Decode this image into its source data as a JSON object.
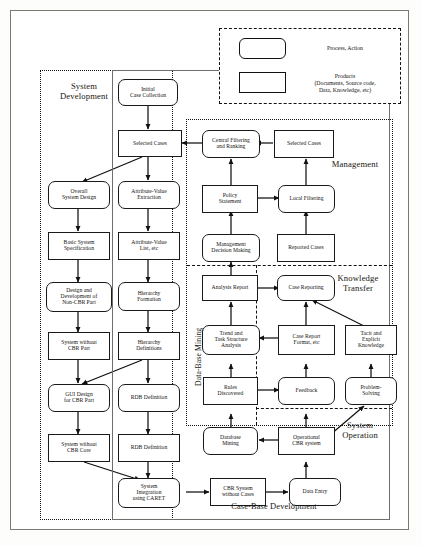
{
  "legend": {
    "process_label": "Process, Action",
    "product_label_line1": "Products",
    "product_label_line2": "(Documents, Source code,",
    "product_label_line3": "Data, Knowledge, etc)"
  },
  "regions": {
    "system_development": "System\nDevelopment",
    "system_development_l1": "System",
    "system_development_l2": "Development",
    "management": "Management",
    "knowledge_transfer_l1": "Knowledge",
    "knowledge_transfer_l2": "Transfer",
    "system_operation_l1": "System",
    "system_operation_l2": "Operation",
    "data_base_mining": "Data-Base Mining",
    "case_base_development": "Case-Base Development"
  },
  "nodes": {
    "initial_case_collection": "Initial\nCase Collection",
    "selected_cases_left": "Selected Cases",
    "overall_system_design": "Overall\nSystem Design",
    "attribute_value_extraction": "Attribute-Value\nExtraction",
    "basic_system_specification": "Basic System\nSpecification",
    "attribute_value_list": "Attribute-Value\nList, etc",
    "design_development_non_cbr": "Design and\nDevelopment of\nNon-CBR Part",
    "hierarchy_formation": "Hierarchy\nFormation",
    "system_without_cbr_part": "System without\nCBR Part",
    "hierarchy_definitions": "Hierarchy\nDefinitions",
    "gui_design_for_cbr_part": "GUI Design\nfor CBR Part",
    "rdb_definition_1": "RDB Definition",
    "system_without_cbr_core": "System without\nCBR Core",
    "rdb_definition_2": "RDB Definition",
    "system_integration_caret": "System\nIntegration\nusing CARET",
    "cbr_system_without_cases": "CBR System\nwithout Cases",
    "data_entry": "Data Entry",
    "central_filtering_ranking": "Central Filtering\nand Ranking",
    "selected_cases_right": "Selected Cases",
    "policy_statement": "Policy\nStatement",
    "local_filtering": "Local Filtering",
    "management_decision_making": "Management\nDecision Making",
    "reported_cases": "Reported Cases",
    "analysis_report": "Analysis Report",
    "case_reporting": "Case Reporting",
    "trend_task_structure_analysis": "Trend and\nTask Structure\nAnalysis",
    "case_report_format": "Case Report\nFormat, etc",
    "tacit_explicit_knowledge": "Tacit and\nExplicit\nKnowledge",
    "rules_discovered": "Rules\nDiscovered",
    "feedback": "Feedback",
    "problem_solving": "Problem-\nSolving",
    "database_mining": "Database\nMining",
    "operational_cbr_system": "Operational\nCBR system"
  },
  "colors": {
    "stroke": "#1a1a1a",
    "page_bg": "#ffffff",
    "frame": "#7a7a75"
  }
}
